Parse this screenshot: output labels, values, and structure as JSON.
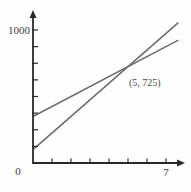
{
  "chart_data": {
    "type": "line",
    "title": "",
    "xlabel": "",
    "ylabel": "",
    "xlim": [
      0,
      7.9
    ],
    "ylim": [
      0,
      1120
    ],
    "x_ticks": [
      1,
      2,
      3,
      4,
      5,
      6,
      7
    ],
    "y_ticks": [
      125,
      250,
      375,
      500,
      625,
      750,
      875,
      1000
    ],
    "grid": false,
    "legend": false,
    "series": [
      {
        "name": "steep-line",
        "equation": "y = 125x + 100",
        "x": [
          0,
          7.65
        ],
        "y": [
          100,
          1056
        ]
      },
      {
        "name": "shallow-line",
        "equation": "y = 75x + 350",
        "x": [
          0,
          7.65
        ],
        "y": [
          350,
          924
        ]
      }
    ],
    "intersection": {
      "x": 5,
      "y": 725
    },
    "annotations": [
      {
        "text": "(5, 725)",
        "x": 5,
        "y": 725
      }
    ]
  },
  "labels": {
    "y_top": "1000",
    "origin": "0",
    "x_right": "7",
    "intersection": "(5, 725)"
  },
  "colors": {
    "background": "#fefefe",
    "axis": "#2a2a2a",
    "line": "#6d6d6d",
    "text": "#3d3d3d"
  }
}
